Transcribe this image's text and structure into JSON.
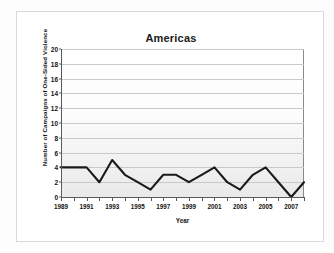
{
  "chart_data": {
    "type": "line",
    "title": "Americas",
    "xlabel": "Year",
    "ylabel": "Number of Campaigns of One-Sided Violence",
    "x": [
      1989,
      1990,
      1991,
      1992,
      1993,
      1994,
      1995,
      1996,
      1997,
      1998,
      1999,
      2000,
      2001,
      2002,
      2003,
      2004,
      2005,
      2006,
      2007,
      2008
    ],
    "values": [
      4,
      4,
      4,
      2,
      5,
      3,
      2,
      1,
      3,
      3,
      2,
      3,
      4,
      2,
      1,
      3,
      4,
      2,
      0,
      2
    ],
    "series": [
      {
        "name": "Americas",
        "values": [
          4,
          4,
          4,
          2,
          5,
          3,
          2,
          1,
          3,
          3,
          2,
          3,
          4,
          2,
          1,
          3,
          4,
          2,
          0,
          2
        ]
      }
    ],
    "ylim": [
      0,
      20
    ],
    "xlim": [
      1989,
      2008
    ],
    "ytick_labels": [
      "0",
      "2",
      "4",
      "6",
      "8",
      "10",
      "12",
      "14",
      "16",
      "18",
      "20"
    ],
    "ytick_values": [
      0,
      2,
      4,
      6,
      8,
      10,
      12,
      14,
      16,
      18,
      20
    ],
    "xtick_labels": [
      "1989",
      "1991",
      "1993",
      "1995",
      "1997",
      "1999",
      "2001",
      "2003",
      "2005",
      "2007"
    ],
    "xtick_values": [
      1989,
      1991,
      1993,
      1995,
      1997,
      1999,
      2001,
      2003,
      2005,
      2007
    ],
    "grid": true,
    "legend": false,
    "line_color": "#1a1a1a",
    "plot_background": "#f4f4f4",
    "gridline_color": "#c9c9c9"
  }
}
